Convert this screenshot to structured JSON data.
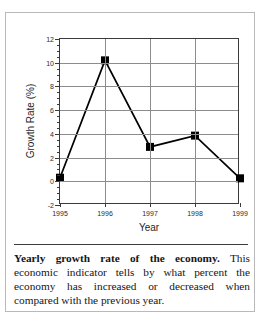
{
  "figure": {
    "caption_lead": "Yearly growth rate of the economy.",
    "caption_body": " This economic indicator tells by what percent the economy has increased or decreased when compared with the previous year."
  },
  "chart_data": {
    "type": "line",
    "title": "",
    "xlabel": "Year",
    "ylabel": "Growth Rate (%)",
    "categories": [
      "1995",
      "1996",
      "1997",
      "1998",
      "1999"
    ],
    "x": [
      1995,
      1996,
      1997,
      1998,
      1999
    ],
    "values": [
      0.3,
      10.2,
      2.9,
      3.85,
      0.25
    ],
    "series": [
      {
        "name": "Growth Rate",
        "values": [
          0.3,
          10.2,
          2.9,
          3.85,
          0.25
        ],
        "color": "#000000",
        "marker": "square",
        "marker_color": "#000000"
      }
    ],
    "ylim": [
      -2,
      12
    ],
    "xlim": [
      1995,
      1999
    ],
    "ytick_labels": [
      "-2",
      "0",
      "2",
      "4",
      "6",
      "8",
      "10",
      "12"
    ],
    "yticks": [
      -2,
      0,
      2,
      4,
      6,
      8,
      10,
      12
    ],
    "ytick_minor_step": 0.5,
    "xtick_labels": [
      "1995",
      "1996",
      "1997",
      "1998",
      "1999"
    ],
    "grid": "both",
    "grid_color": "#8d8d8d",
    "legend": "none",
    "axis_color": "#3a3a3a",
    "background": "#ffffff"
  }
}
